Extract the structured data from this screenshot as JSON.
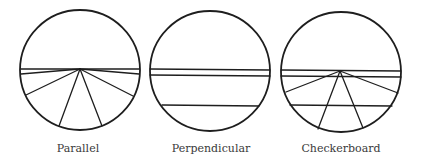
{
  "figure": {
    "stroke_color": "#1e1e1e",
    "label_color": "#3a3a3a",
    "panels": [
      {
        "label": "Parallel",
        "circle": {
          "cx": 80,
          "cy": 70,
          "r": 60
        },
        "label_pos": {
          "x": 78,
          "y": 152
        },
        "lines": [
          {
            "x1": 21,
            "y1": 69,
            "x2": 139,
            "y2": 69
          },
          {
            "x1": 21,
            "y1": 74,
            "x2": 80,
            "y2": 69
          },
          {
            "x1": 80,
            "y1": 69,
            "x2": 139,
            "y2": 74
          },
          {
            "x1": 80,
            "y1": 69,
            "x2": 26,
            "y2": 95
          },
          {
            "x1": 80,
            "y1": 69,
            "x2": 59,
            "y2": 126
          },
          {
            "x1": 80,
            "y1": 69,
            "x2": 102,
            "y2": 126
          },
          {
            "x1": 80,
            "y1": 69,
            "x2": 133,
            "y2": 96
          }
        ]
      },
      {
        "label": "Perpendicular",
        "circle": {
          "cx": 210,
          "cy": 71,
          "r": 60
        },
        "label_pos": {
          "x": 211,
          "y": 152
        },
        "lines": [
          {
            "x1": 150,
            "y1": 69,
            "x2": 270,
            "y2": 70
          },
          {
            "x1": 150,
            "y1": 75,
            "x2": 270,
            "y2": 76
          },
          {
            "x1": 162,
            "y1": 105,
            "x2": 259,
            "y2": 106
          }
        ]
      },
      {
        "label": "Checkerboard",
        "circle": {
          "cx": 341,
          "cy": 72,
          "r": 60
        },
        "label_pos": {
          "x": 341,
          "y": 152
        },
        "lines": [
          {
            "x1": 281,
            "y1": 70,
            "x2": 401,
            "y2": 71
          },
          {
            "x1": 281,
            "y1": 76,
            "x2": 401,
            "y2": 77
          },
          {
            "x1": 290,
            "y1": 105,
            "x2": 392,
            "y2": 106
          },
          {
            "x1": 340,
            "y1": 71,
            "x2": 286,
            "y2": 92
          },
          {
            "x1": 340,
            "y1": 71,
            "x2": 398,
            "y2": 93
          },
          {
            "x1": 340,
            "y1": 71,
            "x2": 318,
            "y2": 129
          },
          {
            "x1": 340,
            "y1": 71,
            "x2": 363,
            "y2": 128
          }
        ]
      }
    ]
  }
}
